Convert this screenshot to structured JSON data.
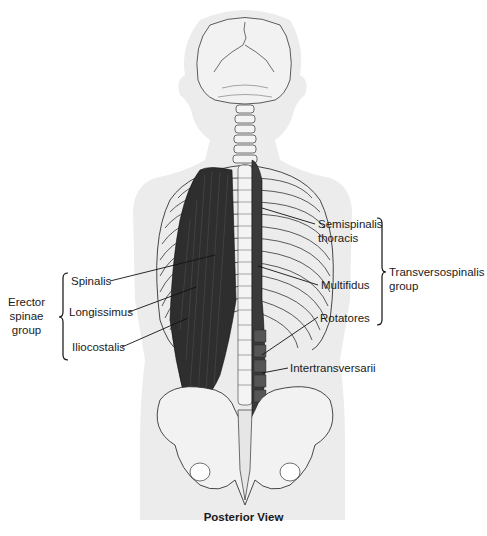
{
  "figure": {
    "view": "Posterior View",
    "colors": {
      "background": "#ffffff",
      "body_silhouette": "#ececec",
      "bone_fill": "#f4f4f4",
      "outline": "#222222",
      "muscle": "#2e2e2e",
      "label_text": "#1a1a1a"
    }
  },
  "labels": {
    "left": {
      "group": "Erector\nspinae\ngroup",
      "group_lines": [
        "Erector",
        "spinae",
        "group"
      ],
      "items": [
        "Spinalis",
        "Longissimus",
        "Iliocostalis"
      ]
    },
    "right": {
      "group_lines": [
        "Transversospinalis",
        "group"
      ],
      "items": [
        {
          "lines": [
            "Semispinalis",
            "thoracis"
          ]
        },
        {
          "lines": [
            "Multifidus"
          ]
        },
        {
          "lines": [
            "Rotatores"
          ]
        }
      ]
    },
    "standalone": [
      "Intertransversarii"
    ]
  }
}
